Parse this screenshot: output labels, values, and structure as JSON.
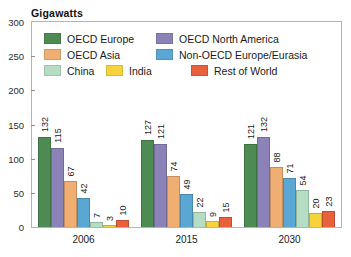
{
  "chart_data": {
    "type": "bar",
    "title": "",
    "ylabel": "Gigawatts",
    "xlabel": "",
    "ylim": [
      0,
      300
    ],
    "yticks": [
      0,
      50,
      100,
      150,
      200,
      250,
      300
    ],
    "ytick_labels": [
      "0",
      "50",
      "100",
      "150",
      "200",
      "250",
      "300"
    ],
    "grid": false,
    "legend_position": "inside-top-left",
    "categories": [
      "2006",
      "2015",
      "2030"
    ],
    "series": [
      {
        "name": "OECD Europe",
        "color": "#4e8b52",
        "values": [
          132,
          127,
          121
        ]
      },
      {
        "name": "OECD North America",
        "color": "#8b82b8",
        "values": [
          115,
          121,
          132
        ]
      },
      {
        "name": "OECD Asia",
        "color": "#f0ae73",
        "values": [
          67,
          74,
          88
        ]
      },
      {
        "name": "Non-OECD Europe/Eurasia",
        "color": "#5ba7d4",
        "values": [
          42,
          49,
          71
        ]
      },
      {
        "name": "China",
        "color": "#b4ddc4",
        "values": [
          7,
          22,
          54
        ]
      },
      {
        "name": "India",
        "color": "#f6d33c",
        "values": [
          3,
          9,
          20
        ]
      },
      {
        "name": "Rest of World",
        "color": "#e8603c",
        "values": [
          10,
          15,
          23
        ]
      }
    ],
    "legend_rows": [
      [
        {
          "name": "OECD Europe",
          "color": "#4e8b52"
        },
        {
          "name": "OECD North America",
          "color": "#8b82b8"
        }
      ],
      [
        {
          "name": "OECD Asia",
          "color": "#f0ae73"
        },
        {
          "name": "Non-OECD Europe/Eurasia",
          "color": "#5ba7d4"
        }
      ],
      [
        {
          "name": "China",
          "color": "#b4ddc4"
        },
        {
          "name": "India",
          "color": "#f6d33c"
        },
        {
          "name": "Rest of World",
          "color": "#e8603c"
        }
      ]
    ]
  },
  "axis": {
    "y_unit_title": "Gigawatts"
  }
}
